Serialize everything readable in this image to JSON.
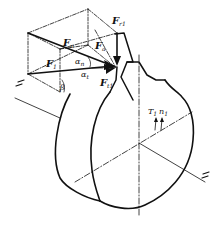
{
  "diagram": {
    "colors": {
      "stroke": "#111111",
      "background": "#ffffff"
    },
    "labels": {
      "Fr1": {
        "main": "F",
        "sub": "r1"
      },
      "Fn": {
        "main": "F",
        "sub": "n"
      },
      "Fa": {
        "main": "F",
        "sub": "a"
      },
      "F1": {
        "main": "F",
        "sub": "1"
      },
      "Ft1": {
        "main": "F",
        "sub": "t1"
      },
      "alpha_n": {
        "main": "α",
        "sub": "n"
      },
      "alpha_t": {
        "main": "α",
        "sub": "t"
      },
      "beta": {
        "main": "β"
      },
      "T1": {
        "main": "T",
        "sub": "1"
      },
      "n1": {
        "main": "n",
        "sub": "1"
      }
    }
  }
}
